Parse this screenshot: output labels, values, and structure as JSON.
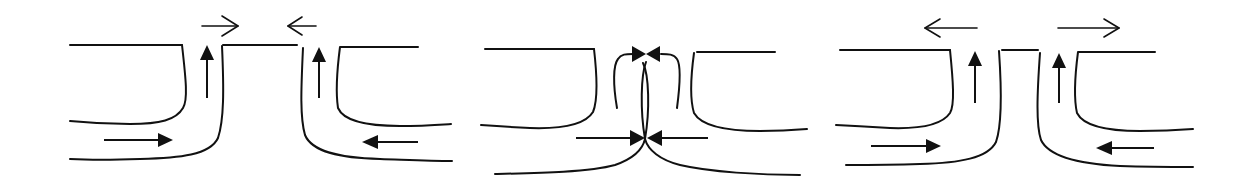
{
  "diagram": {
    "title": "",
    "description": "Three schematic panels of converging flow into a channel gap between two walls",
    "stroke_color": "#111111",
    "background": "#ffffff",
    "panels": [
      {
        "id": "panel-1",
        "label": "",
        "top_arrows": [
          "right",
          "left"
        ],
        "side_arrows": [
          "up",
          "up"
        ],
        "bottom_arrows": [
          "right",
          "left"
        ]
      },
      {
        "id": "panel-2",
        "label": "",
        "top_arrows": [
          "converging-filled"
        ],
        "side_arrows": [
          "curved-inward",
          "curved-inward"
        ],
        "bottom_arrows": [
          "right",
          "left"
        ]
      },
      {
        "id": "panel-3",
        "label": "",
        "top_arrows": [
          "left",
          "right"
        ],
        "side_arrows": [
          "up",
          "up"
        ],
        "bottom_arrows": [
          "right",
          "left"
        ]
      }
    ]
  }
}
